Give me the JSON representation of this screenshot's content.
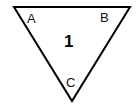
{
  "figure": {
    "type": "geometry-diagram",
    "canvas": {
      "width": 139,
      "height": 107,
      "background_color": "#ffffff"
    },
    "shape": {
      "name": "triangle",
      "orientation": "point-down",
      "stroke_color": "#000000",
      "stroke_width": 2,
      "fill": "none",
      "points": "14,7 130,7 72,101",
      "vertices": [
        {
          "label": "A",
          "x": 14,
          "y": 7,
          "label_position": "inside-top-left"
        },
        {
          "label": "B",
          "x": 130,
          "y": 7,
          "label_position": "inside-top-right"
        },
        {
          "label": "C",
          "x": 72,
          "y": 101,
          "label_position": "inside-bottom-apex"
        }
      ]
    },
    "labels": {
      "vertex_a": "A",
      "vertex_b": "B",
      "vertex_c": "C",
      "region_1": "1"
    }
  }
}
